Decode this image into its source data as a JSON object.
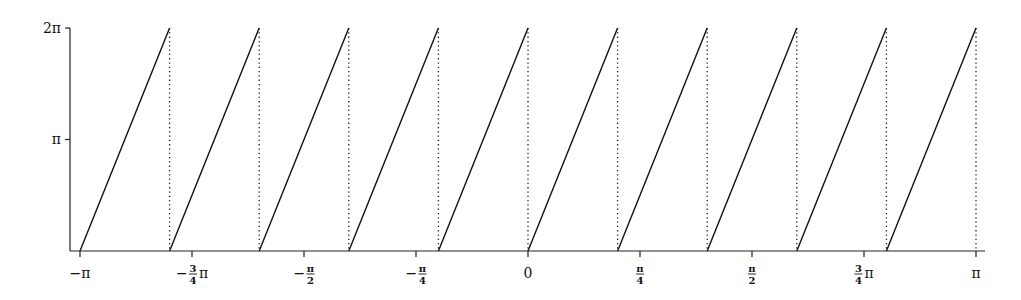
{
  "chart_data": {
    "type": "line",
    "title": "",
    "xlabel": "",
    "ylabel": "",
    "xlim": [
      -3.14159,
      3.14159
    ],
    "ylim": [
      0,
      6.28318
    ],
    "grid": false,
    "legend": null,
    "series": [
      {
        "name": "wrapped phase",
        "style": "solid",
        "segments": [
          {
            "x": [
              -3.1416,
              -2.5133
            ],
            "y": [
              0,
              6.2832
            ]
          },
          {
            "x": [
              -2.5133,
              -1.885
            ],
            "y": [
              0,
              6.2832
            ]
          },
          {
            "x": [
              -1.885,
              -1.2566
            ],
            "y": [
              0,
              6.2832
            ]
          },
          {
            "x": [
              -1.2566,
              -0.6283
            ],
            "y": [
              0,
              6.2832
            ]
          },
          {
            "x": [
              -0.6283,
              0.0
            ],
            "y": [
              0,
              6.2832
            ]
          },
          {
            "x": [
              0.0,
              0.6283
            ],
            "y": [
              0,
              6.2832
            ]
          },
          {
            "x": [
              0.6283,
              1.2566
            ],
            "y": [
              0,
              6.2832
            ]
          },
          {
            "x": [
              1.2566,
              1.885
            ],
            "y": [
              0,
              6.2832
            ]
          },
          {
            "x": [
              1.885,
              2.5133
            ],
            "y": [
              0,
              6.2832
            ]
          },
          {
            "x": [
              2.5133,
              3.1416
            ],
            "y": [
              0,
              6.2832
            ]
          }
        ]
      },
      {
        "name": "wrap discontinuities",
        "style": "dotted",
        "x": [
          -2.5133,
          -1.885,
          -1.2566,
          -0.6283,
          0.0,
          0.6283,
          1.2566,
          1.885,
          2.5133,
          3.1416
        ]
      }
    ],
    "x_ticks": [
      {
        "value": -3.1416,
        "label": "−π",
        "kind": "plain",
        "text": "−π"
      },
      {
        "value": -2.3562,
        "label": "−¾π",
        "kind": "frac",
        "prefix": "−",
        "num": "3",
        "den": "4",
        "suffix": "π"
      },
      {
        "value": -1.5708,
        "label": "−π/2",
        "kind": "frac",
        "prefix": "−",
        "num": "π",
        "den": "2",
        "suffix": ""
      },
      {
        "value": -0.7854,
        "label": "−π/4",
        "kind": "frac",
        "prefix": "−",
        "num": "π",
        "den": "4",
        "suffix": ""
      },
      {
        "value": 0,
        "label": "0",
        "kind": "plain",
        "text": "0"
      },
      {
        "value": 0.7854,
        "label": "π/4",
        "kind": "frac",
        "prefix": "",
        "num": "π",
        "den": "4",
        "suffix": ""
      },
      {
        "value": 1.5708,
        "label": "π/2",
        "kind": "frac",
        "prefix": "",
        "num": "π",
        "den": "2",
        "suffix": ""
      },
      {
        "value": 2.3562,
        "label": "¾π",
        "kind": "frac",
        "prefix": "",
        "num": "3",
        "den": "4",
        "suffix": "π"
      },
      {
        "value": 3.1416,
        "label": "π",
        "kind": "plain",
        "text": "π"
      }
    ],
    "y_ticks": [
      {
        "value": 3.1416,
        "label": "π"
      },
      {
        "value": 6.2832,
        "label": "2π"
      }
    ],
    "colors": {
      "line": "#111111",
      "axis": "#222222",
      "dotted": "#222222"
    }
  },
  "labels": {
    "y_pi": "π",
    "y_2pi": "2π"
  }
}
